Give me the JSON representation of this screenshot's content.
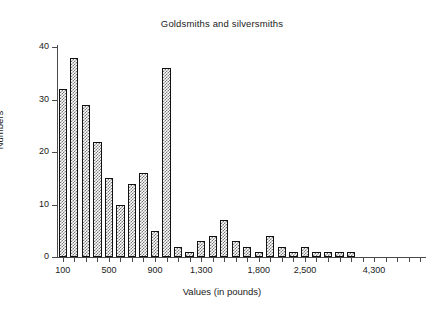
{
  "chart_data": {
    "type": "bar",
    "title": "Goldsmiths and silversmiths",
    "xlabel": "Values (in pounds)",
    "ylabel": "Numbers",
    "ylim": [
      0,
      40
    ],
    "ytick_labels": [
      "0",
      "10",
      "20",
      "30",
      "40"
    ],
    "ytick_values": [
      0,
      10,
      20,
      30,
      40
    ],
    "xtick_labels": [
      "100",
      "500",
      "900",
      "1,300",
      "1,800",
      "2,500",
      "4,300"
    ],
    "grid": "off",
    "legend": "none",
    "bar_style": "cross-hatch fill with black outline",
    "categories": [
      "100",
      "200",
      "300",
      "400",
      "500",
      "600",
      "700",
      "800",
      "900",
      "1,000",
      "1,100",
      "1,200",
      "1,300",
      "1,400",
      "1,500",
      "1,600",
      "1,700",
      "1,800",
      "1,900",
      "2,000",
      "2,200",
      "2,500",
      "2,800",
      "3,100",
      "3,400",
      "3,700",
      "4,000",
      "4,300",
      "4,600",
      "4,900",
      "5,200",
      "5,500"
    ],
    "values": [
      32,
      38,
      29,
      22,
      15,
      10,
      14,
      16,
      5,
      36,
      2,
      1,
      3,
      4,
      7,
      3,
      2,
      1,
      4,
      2,
      1,
      2,
      1,
      1,
      1,
      1,
      0,
      0,
      0,
      0,
      0,
      0
    ]
  },
  "colors": {
    "axis": "#4a4a4a",
    "bar_outline": "#111111",
    "bar_hatch": "#7a7a7a",
    "text": "#1a1a1a",
    "background": "#ffffff"
  }
}
